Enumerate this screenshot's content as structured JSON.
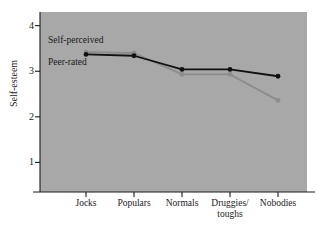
{
  "chart_data": {
    "type": "line",
    "title": "",
    "xlabel": "",
    "ylabel": "Self-esteem",
    "categories": [
      "Jocks",
      "Populars",
      "Normals",
      "Druggies/\ntoughs",
      "Nobodies"
    ],
    "ylim": [
      0.35,
      4.3
    ],
    "yticks": [
      1,
      2,
      3,
      4
    ],
    "ytick_labels": [
      "1",
      "2",
      "3",
      "4"
    ],
    "grid": false,
    "legend_position": "in-plot-annotations",
    "series": [
      {
        "name": "Self-perceived",
        "color": "#8c8c8c",
        "marker": "circle",
        "values": [
          3.42,
          3.4,
          2.93,
          2.93,
          2.36
        ]
      },
      {
        "name": "Peer-rated",
        "color": "#111111",
        "marker": "circle",
        "values": [
          3.37,
          3.34,
          3.04,
          3.04,
          2.89
        ]
      }
    ],
    "annotations": [
      {
        "text": "Self-perceived"
      },
      {
        "text": "Peer-rated"
      }
    ]
  },
  "axis": {
    "y_title": "Self-esteem",
    "y_tick_1": "1",
    "y_tick_2": "2",
    "y_tick_3": "3",
    "y_tick_4": "4",
    "x_label_0": "Jocks",
    "x_label_1": "Populars",
    "x_label_2": "Normals",
    "x_label_3": "Druggies/\ntoughs",
    "x_label_4": "Nobodies"
  },
  "annotations": {
    "self_perceived": "Self-perceived",
    "peer_rated": "Peer-rated"
  },
  "colors": {
    "panel_background": "#a8a8a8",
    "page_background": "#ffffff",
    "axis": "#1a1a1a",
    "series_self_perceived": "#8c8c8c",
    "series_peer_rated": "#111111"
  }
}
